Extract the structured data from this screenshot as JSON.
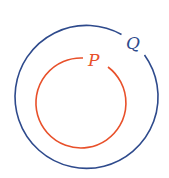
{
  "diagram": {
    "type": "venn-subset",
    "sets": [
      {
        "id": "Q",
        "label": "Q",
        "color": "#2e4a8c",
        "role": "outer"
      },
      {
        "id": "P",
        "label": "P",
        "color": "#e8502a",
        "role": "inner"
      }
    ],
    "relation": "P ⊂ Q"
  }
}
